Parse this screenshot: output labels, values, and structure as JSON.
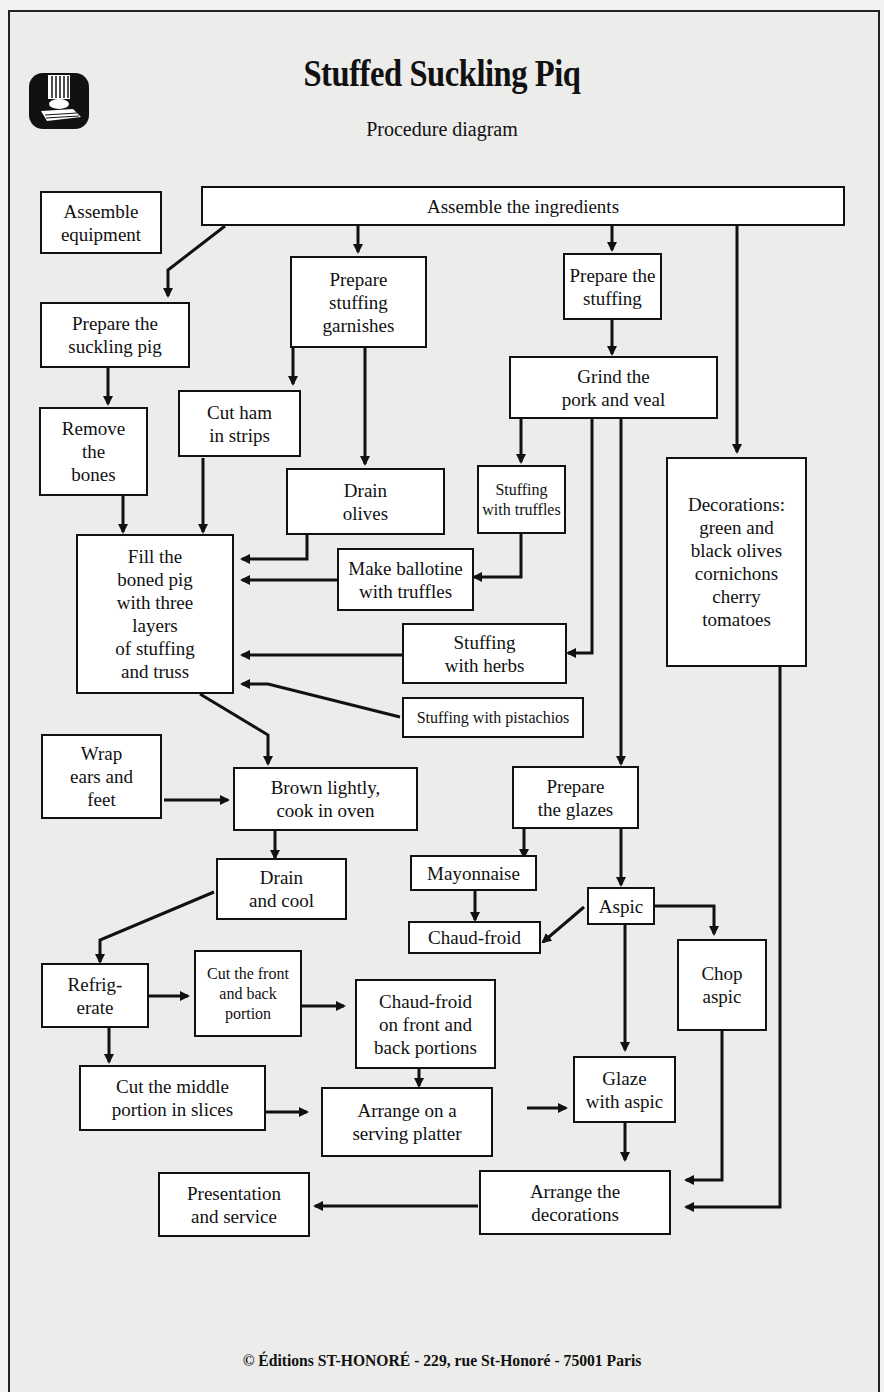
{
  "header": {
    "title": "Stuffed Suckling Piq",
    "subtitle": "Procedure diagram",
    "logo_icon": "chef-hat-book-icon"
  },
  "nodes": {
    "assemble_equipment": "Assemble\nequipment",
    "assemble_ingredients": "Assemble the ingredients",
    "prepare_pig": "Prepare the\nsuckling pig",
    "prepare_garnishes": "Prepare\nstuffing\ngarnishes",
    "prepare_stuffing": "Prepare the\nstuffing",
    "grind": "Grind the\npork and veal",
    "remove_bones": "Remove\nthe\nbones",
    "cut_ham": "Cut ham\nin strips",
    "drain_olives": "Drain\nolives",
    "stuffing_truffles": "Stuffing\nwith truffles",
    "decorations": "Decorations:\ngreen and\nblack olives\ncornichons\ncherry\ntomatoes",
    "fill_pig": "Fill the\nboned pig\nwith three\nlayers\nof stuffing\nand truss",
    "make_ballotine": "Make ballotine\nwith truffles",
    "stuffing_herbs": "Stuffing\nwith herbs",
    "stuffing_pistachios": "Stuffing with pistachios",
    "wrap_ears": "Wrap\nears and\nfeet",
    "brown": "Brown lightly,\ncook in oven",
    "prepare_glazes": "Prepare\nthe glazes",
    "drain_cool": "Drain\nand cool",
    "mayonnaise": "Mayonnaise",
    "aspic": "Aspic",
    "chaud_froid": "Chaud-froid",
    "chop_aspic": "Chop\naspic",
    "refrigerate": "Refrig-\nerate",
    "cut_front_back": "Cut the front\nand back\nportion",
    "chaud_froid_portions": "Chaud-froid\non front and\nback portions",
    "cut_middle": "Cut the middle\nportion in slices",
    "arrange_platter": "Arrange on a\nserving platter",
    "glaze_aspic": "Glaze\nwith aspic",
    "presentation": "Presentation\nand service",
    "arrange_decorations": "Arrange the\ndecorations"
  },
  "footer": {
    "copyright_icon": "copyright-icon",
    "text": "© Éditions ST-HONORÉ - 229, rue St-Honoré - 75001 Paris"
  },
  "colors": {
    "background": "#ececea",
    "box_fill": "#ffffff",
    "line": "#111111"
  }
}
